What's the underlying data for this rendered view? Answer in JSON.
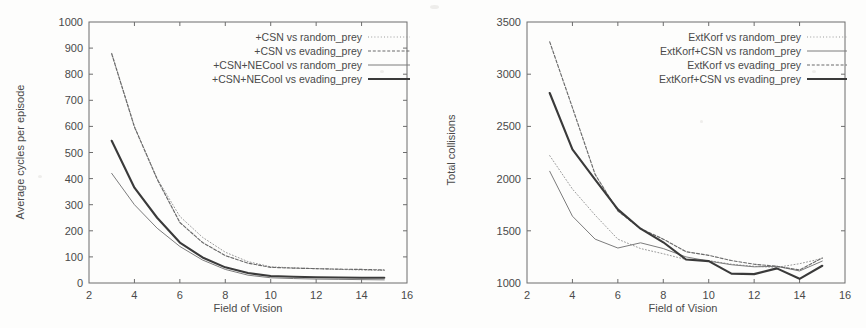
{
  "figure": {
    "background_color": "#fdfdfc",
    "ink_color": "#4a4a4a"
  },
  "chart_data": [
    {
      "type": "line",
      "title": "",
      "xlabel": "Field of Vision",
      "ylabel": "Average cycles per episode",
      "xlim": [
        2,
        16
      ],
      "ylim": [
        0,
        1000
      ],
      "xticks": [
        2,
        4,
        6,
        8,
        10,
        12,
        14,
        16
      ],
      "yticks": [
        0,
        100,
        200,
        300,
        400,
        500,
        600,
        700,
        800,
        900,
        1000
      ],
      "grid": false,
      "legend_position": "top-right",
      "x": [
        3,
        4,
        5,
        6,
        7,
        8,
        9,
        10,
        11,
        12,
        13,
        14,
        15
      ],
      "series": [
        {
          "name": "+CSN vs random_prey",
          "style": "dotted",
          "color": "#9a9a9a",
          "values": [
            880,
            600,
            400,
            255,
            175,
            118,
            82,
            62,
            58,
            55,
            52,
            50,
            48
          ]
        },
        {
          "name": "+CSN vs evading_prey",
          "style": "dashed",
          "color": "#6a6a6a",
          "values": [
            878,
            598,
            398,
            232,
            155,
            105,
            76,
            60,
            57,
            55,
            53,
            52,
            50
          ]
        },
        {
          "name": "+CSN+NECool vs random_prey",
          "style": "thin-solid",
          "color": "#7c7c7c",
          "values": [
            420,
            300,
            210,
            140,
            88,
            52,
            30,
            20,
            17,
            15,
            14,
            13,
            12
          ]
        },
        {
          "name": "+CSN+NECool vs evading_prey",
          "style": "thick-solid",
          "color": "#3a3a3a",
          "values": [
            545,
            365,
            250,
            155,
            98,
            60,
            38,
            27,
            24,
            22,
            21,
            20,
            20
          ]
        }
      ]
    },
    {
      "type": "line",
      "title": "",
      "xlabel": "Field of Vision",
      "ylabel": "Total collisions",
      "xlim": [
        2,
        16
      ],
      "ylim": [
        1000,
        3500
      ],
      "xticks": [
        2,
        4,
        6,
        8,
        10,
        12,
        14,
        16
      ],
      "yticks": [
        1000,
        1500,
        2000,
        2500,
        3000,
        3500
      ],
      "grid": false,
      "legend_position": "top-right",
      "x": [
        3,
        4,
        5,
        6,
        7,
        8,
        9,
        10,
        11,
        12,
        13,
        14,
        15
      ],
      "series": [
        {
          "name": "ExtKorf vs random_prey",
          "style": "dotted",
          "color": "#9a9a9a",
          "values": [
            2220,
            1900,
            1650,
            1420,
            1330,
            1280,
            1225,
            1215,
            1180,
            1160,
            1150,
            1185,
            1235
          ]
        },
        {
          "name": "ExtKorf+CSN vs random_prey",
          "style": "thin-solid",
          "color": "#7c7c7c",
          "values": [
            2070,
            1640,
            1420,
            1335,
            1385,
            1330,
            1250,
            1210,
            1175,
            1155,
            1160,
            1115,
            1210
          ]
        },
        {
          "name": "ExtKorf vs evading_prey",
          "style": "dashed",
          "color": "#6a6a6a",
          "values": [
            3310,
            2680,
            2040,
            1690,
            1520,
            1420,
            1300,
            1265,
            1215,
            1180,
            1160,
            1125,
            1240
          ]
        },
        {
          "name": "ExtKorf+CSN vs evading_prey",
          "style": "thick-solid",
          "color": "#3a3a3a",
          "values": [
            2820,
            2280,
            1990,
            1705,
            1520,
            1390,
            1225,
            1210,
            1090,
            1085,
            1140,
            1040,
            1165
          ]
        }
      ]
    }
  ]
}
